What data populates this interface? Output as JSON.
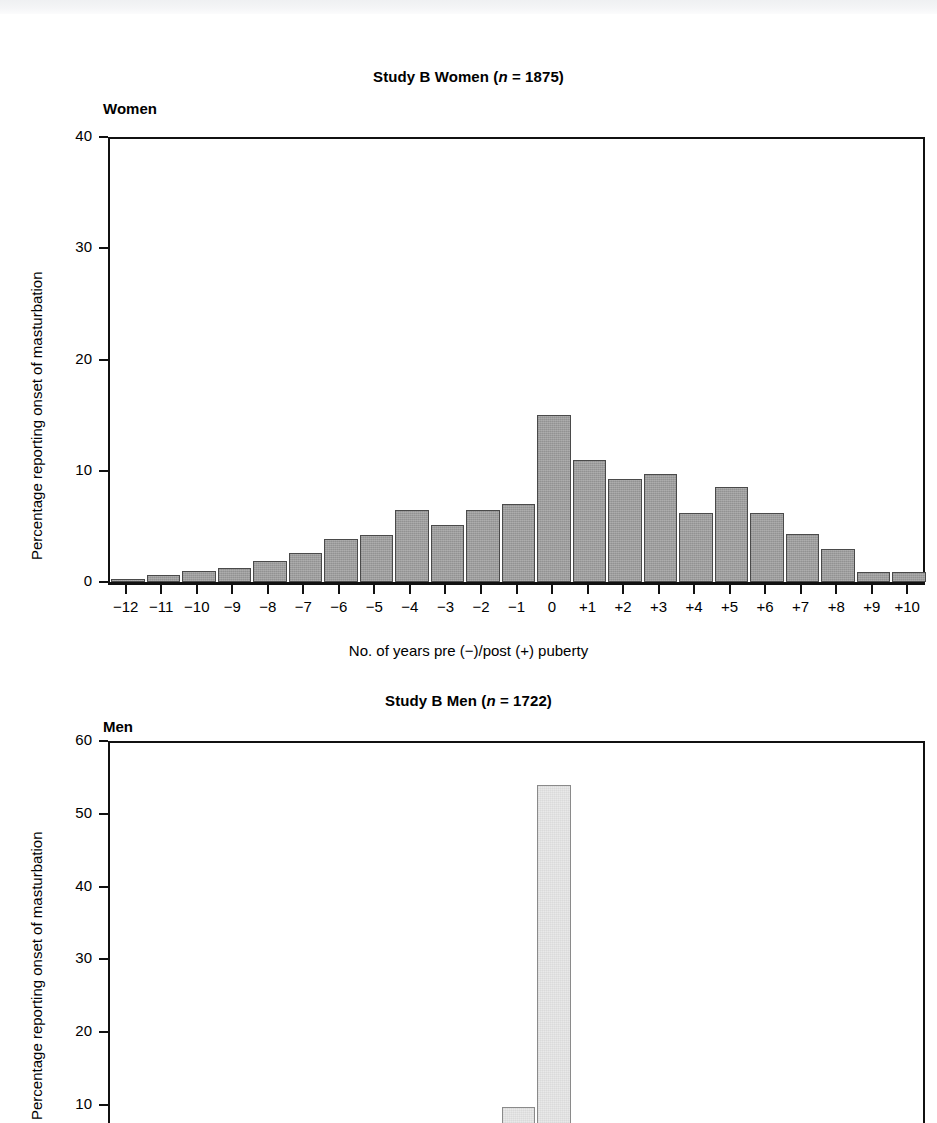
{
  "figure_women": {
    "title_prefix": "Study B  Women (",
    "title_italic": "n",
    "title_suffix": " = 1875)",
    "panel_label": "Women",
    "ylabel": "Percentage reporting onset of masturbation",
    "xlabel": "No. of years pre (−)/post (+) puberty"
  },
  "figure_men": {
    "title_prefix": "Study B  Men (",
    "title_italic": "n",
    "title_suffix": " = 1722)",
    "panel_label": "Men",
    "ylabel": "Percentage reporting onset of masturbation"
  },
  "chart_data": [
    {
      "type": "bar",
      "id": "study-b-women",
      "title": "Study B  Women (n = 1875)",
      "panel_label": "Women",
      "xlabel": "No. of years pre (−)/post (+) puberty",
      "ylabel": "Percentage reporting onset of masturbation",
      "n": 1875,
      "ylim": [
        0,
        40
      ],
      "yticks": [
        0,
        10,
        20,
        30,
        40
      ],
      "ytick_labels": [
        "0",
        "10",
        "20",
        "30",
        "40"
      ],
      "grid": false,
      "legend": "none",
      "bar_color": "#9d9d9d",
      "bar_edge_color": "#4a4a4a",
      "categories": [
        "−12",
        "−11",
        "−10",
        "−9",
        "−8",
        "−7",
        "−6",
        "−5",
        "−4",
        "−3",
        "−2",
        "−1",
        "0",
        "+1",
        "+2",
        "+3",
        "+4",
        "+5",
        "+6",
        "+7",
        "+8",
        "+9",
        "+10"
      ],
      "values": [
        0.3,
        0.6,
        1.0,
        1.3,
        1.9,
        2.6,
        3.9,
        4.2,
        6.5,
        5.1,
        6.5,
        7.0,
        15.0,
        11.0,
        9.3,
        9.7,
        6.2,
        8.5,
        6.2,
        4.3,
        3.0,
        0.9,
        0.9
      ]
    },
    {
      "type": "bar",
      "id": "study-b-men",
      "title": "Study B  Men (n = 1722)",
      "panel_label": "Men",
      "xlabel": "",
      "ylabel": "Percentage reporting onset of masturbation",
      "n": 1722,
      "ylim": [
        0,
        60
      ],
      "yticks": [
        10,
        20,
        30,
        40,
        50,
        60
      ],
      "ytick_labels": [
        "10",
        "20",
        "30",
        "40",
        "50",
        "60"
      ],
      "grid": false,
      "legend": "none",
      "note": "Figure is cropped at the bottom of the screenshot; only the peak region is visible.",
      "bar_color": "#e9e9e9",
      "bar_edge_color": "#8a8a8a",
      "categories": [
        "−12",
        "−11",
        "−10",
        "−9",
        "−8",
        "−7",
        "−6",
        "−5",
        "−4",
        "−3",
        "−2",
        "−1",
        "0",
        "+1",
        "+2",
        "+3",
        "+4",
        "+5",
        "+6",
        "+7",
        "+8",
        "+9",
        "+10"
      ],
      "values": [
        0,
        0,
        0,
        0,
        0,
        0,
        0,
        0,
        0,
        0,
        0,
        9.7,
        54.0,
        0,
        0,
        0,
        0,
        0,
        0,
        0,
        0,
        0,
        0
      ]
    }
  ]
}
